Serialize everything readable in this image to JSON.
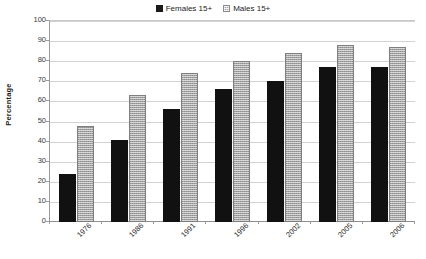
{
  "chart_data": {
    "type": "bar",
    "title": "",
    "subtitle": "",
    "xlabel": "",
    "ylabel": "Percentage",
    "ylim": [
      0,
      100
    ],
    "ytick_step": 10,
    "yticks": [
      100,
      90,
      80,
      70,
      60,
      50,
      40,
      30,
      20,
      10,
      0
    ],
    "categories": [
      "1976",
      "1986",
      "1991",
      "1996",
      "2002",
      "2005",
      "2006"
    ],
    "grid": true,
    "legend_position": "top-center",
    "series": [
      {
        "name": "Females 15+",
        "color": "#111111",
        "pattern": "solid",
        "values": [
          24,
          41,
          56,
          66,
          70,
          77,
          77
        ]
      },
      {
        "name": "Males 15+",
        "color": "#a3a3a3",
        "pattern": "hatched",
        "values": [
          48,
          63,
          74,
          80,
          84,
          88,
          87
        ]
      }
    ],
    "annotations": []
  },
  "legend": {
    "entries": [
      {
        "label": "Females 15+"
      },
      {
        "label": "Males 15+"
      }
    ]
  },
  "axes": {
    "y_title": "Percentage"
  }
}
